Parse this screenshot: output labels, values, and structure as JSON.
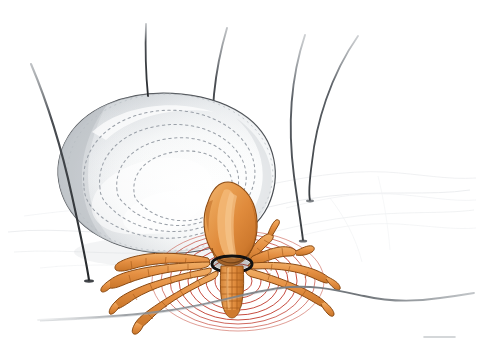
{
  "scene": {
    "title": "Engorged tick feeding on skin",
    "subject": "tick",
    "view": "side view illustration",
    "canvas": {
      "width": 478,
      "height": 356,
      "background": "#ffffff"
    }
  },
  "palette": {
    "background": "#ffffff",
    "body_fill_light": "#ffffff",
    "body_fill_mid": "#eceef0",
    "body_fill_shadow": "#b9bec4",
    "body_outline": "#4a4e53",
    "dashed_ring": "#9aa0a8",
    "tick_orange": "#e08b3c",
    "tick_orange_light": "#efab61",
    "tick_orange_dark": "#b9661f",
    "leg_outline": "#8a4a13",
    "hair_dark": "#2e3135",
    "hair_mid": "#6a6f75",
    "skin_line": "#6f7479",
    "skin_texture": "#d7dade",
    "wave_red": "#c0392b",
    "collar_black": "#111111"
  },
  "elements": {
    "engorged_abdomen": {
      "name": "engorged-tick-abdomen",
      "description": "Large pale swollen tick body, blood filled",
      "dashed_ring_count": 4,
      "fill": "#f2f4f5",
      "outline": "#4a4e53"
    },
    "capitulum": {
      "name": "tick-head-capitulum",
      "description": "Orange bulbous head/scutum region",
      "fill": "#e08b3c"
    },
    "hypostome": {
      "name": "hypostome-feeding-tube",
      "description": "Barbed feeding tube inserted into skin",
      "segments": 7,
      "collar_color": "#111111"
    },
    "legs": {
      "name": "tick-legs",
      "count": 8,
      "left_count": 4,
      "right_count": 4,
      "fill": "#e08b3c",
      "outline": "#8a4a13"
    },
    "hairs": {
      "name": "body-hairs",
      "count": 5,
      "color": "#2e3135"
    },
    "skin_surface": {
      "name": "skin-surface-line",
      "color": "#6f7479"
    },
    "signal_waves": {
      "name": "feeding-signal-waves",
      "count": 9,
      "color": "#c0392b",
      "origin": "hypostome insertion point"
    }
  },
  "labels": {
    "figure_caption": "",
    "annotations": []
  }
}
